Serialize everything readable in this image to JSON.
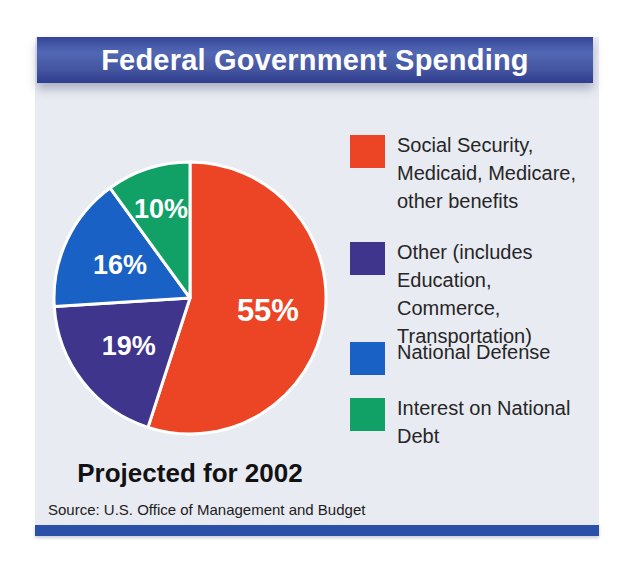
{
  "banner": {
    "title": "Federal Government Spending"
  },
  "caption": {
    "text": "Projected for 2002"
  },
  "source": {
    "text": "Source: U.S. Office of Management and Budget"
  },
  "colors": {
    "background": "#e9ebf2",
    "banner_blue_mid": "#44549f",
    "banner_blue_light": "#5268b4",
    "banner_blue_dark": "#35459a",
    "banner_blue_darker": "#2e3d8e",
    "bottom_bar_blue": "#2b50a8",
    "slice_red": "#ec4526",
    "slice_purple": "#40358d",
    "slice_blue": "#1961c4",
    "slice_green": "#11a167",
    "slice_label_white": "#ffffff",
    "legend_text": "#262626"
  },
  "chart_data": {
    "type": "pie",
    "title": "Federal Government Spending",
    "subtitle": "Projected for 2002",
    "unit": "%",
    "direction": "clockwise",
    "start_angle_deg_from_12oclock": 0,
    "source": "U.S. Office of Management and Budget",
    "slices": [
      {
        "id": "social-security",
        "label": "Social Security, Medicaid, Medicare, other benefits",
        "value": 55,
        "display": "55%",
        "color": "#ec4526"
      },
      {
        "id": "other",
        "label": "Other (includes Education, Commerce, Transportation)",
        "value": 19,
        "display": "19%",
        "color": "#40358d"
      },
      {
        "id": "national-defense",
        "label": "National Defense",
        "value": 16,
        "display": "16%",
        "color": "#1961c4"
      },
      {
        "id": "interest-national-debt",
        "label": "Interest on National Debt",
        "value": 10,
        "display": "10%",
        "color": "#11a167"
      }
    ],
    "legend_position": "right"
  },
  "legend": {
    "items": [
      {
        "id": "social-security",
        "color": "#ec4526",
        "lines": [
          "Social Security,",
          "Medicaid, Medicare,",
          "other benefits"
        ]
      },
      {
        "id": "other",
        "color": "#40358d",
        "lines": [
          "Other (includes",
          "Education, Commerce,",
          "Transportation)"
        ]
      },
      {
        "id": "national-defense",
        "color": "#1961c4",
        "lines": [
          "National Defense"
        ]
      },
      {
        "id": "interest-national-debt",
        "color": "#11a167",
        "lines": [
          "Interest on National",
          "Debt"
        ]
      }
    ]
  }
}
